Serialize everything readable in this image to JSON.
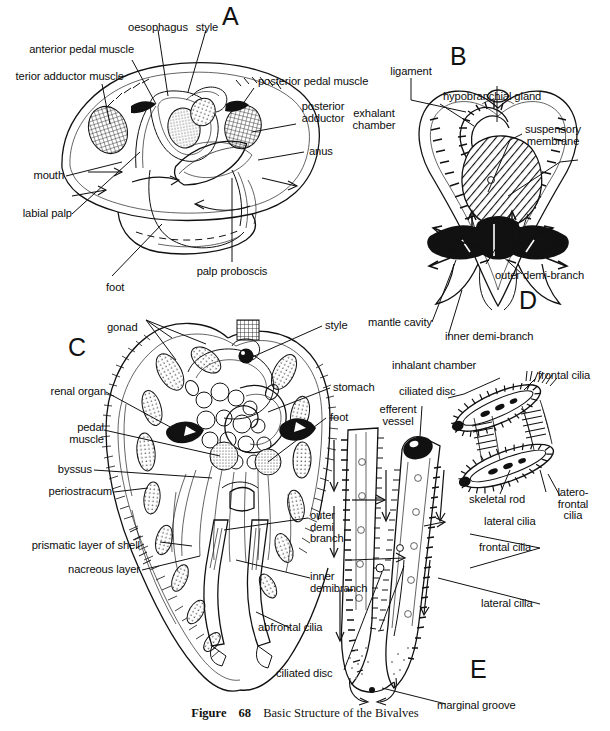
{
  "figure": {
    "caption_label": "Figure",
    "caption_number": "68",
    "caption_title": "Basic Structure of the Bivalves",
    "width": 610,
    "height": 731
  },
  "panels": [
    {
      "id": "A",
      "letter": "A",
      "title": "whole animal, left valve removed"
    },
    {
      "id": "B",
      "letter": "B",
      "title": "transverse section through body"
    },
    {
      "id": "C",
      "letter": "C",
      "title": "transverse section, shell layers"
    },
    {
      "id": "D",
      "letter": "D",
      "title": "gill filaments detail"
    },
    {
      "id": "E",
      "letter": "E",
      "title": "single filament, ciliation"
    }
  ],
  "labels": {
    "panel_a": [
      {
        "name": "oesophagus",
        "text": "oesophagus"
      },
      {
        "name": "style",
        "text": "style"
      },
      {
        "name": "anterior-pedal-muscle",
        "text": "anterior pedal muscle"
      },
      {
        "name": "anterior-adductor-muscle",
        "text": "terior adductor muscle"
      },
      {
        "name": "posterior-pedal-muscle",
        "text": "posterior pedal muscle"
      },
      {
        "name": "posterior-adductor",
        "text": "posterior\nadductor"
      },
      {
        "name": "anus",
        "text": "anus"
      },
      {
        "name": "mouth",
        "text": "mouth"
      },
      {
        "name": "labial-palp",
        "text": "labial palp"
      },
      {
        "name": "foot",
        "text": "foot"
      },
      {
        "name": "palp-proboscis",
        "text": "palp proboscis"
      }
    ],
    "panel_b": [
      {
        "name": "ligament",
        "text": "ligament"
      },
      {
        "name": "hypobranchial-gland",
        "text": "hypobranchial gland"
      },
      {
        "name": "exhalant-chamber",
        "text": "exhalant\nchamber"
      },
      {
        "name": "suspensory-membrane",
        "text": "suspensory\nmembrane"
      },
      {
        "name": "outer-demi-branch",
        "text": "outer demi-branch"
      },
      {
        "name": "inner-demi-branch",
        "text": "inner demi-branch"
      },
      {
        "name": "mantle-cavity",
        "text": "mantle cavity"
      },
      {
        "name": "inhalant-chamber",
        "text": "inhalant chamber"
      }
    ],
    "panel_c": [
      {
        "name": "gonad",
        "text": "gonad"
      },
      {
        "name": "style",
        "text": "style"
      },
      {
        "name": "renal-organ",
        "text": "renal organ"
      },
      {
        "name": "stomach",
        "text": "stomach"
      },
      {
        "name": "pedal-muscle",
        "text": "pedal\nmuscle"
      },
      {
        "name": "foot",
        "text": "foot"
      },
      {
        "name": "byssus",
        "text": "byssus"
      },
      {
        "name": "periostracum",
        "text": "periostracum"
      },
      {
        "name": "prismatic-layer-of-shell",
        "text": "prismatic layer of shell"
      },
      {
        "name": "nacreous-layer",
        "text": "nacreous layer"
      },
      {
        "name": "outer-demi-branch",
        "text": "outer\ndemi\nbranch"
      },
      {
        "name": "inner-demibranch",
        "text": "inner\ndemibranch"
      }
    ],
    "panel_d": [
      {
        "name": "ciliated-disc",
        "text": "ciliated disc"
      },
      {
        "name": "frontal-cilia",
        "text": "frontal cilia"
      },
      {
        "name": "skeletal-rod",
        "text": "skeletal rod"
      },
      {
        "name": "lateral-cilia",
        "text": "lateral cilia"
      },
      {
        "name": "latero-frontal-cilia",
        "text": "latero-\nfrontal\ncilia"
      }
    ],
    "panel_e": [
      {
        "name": "efferent-vessel",
        "text": "efferent\nvessel"
      },
      {
        "name": "frontal-cilia",
        "text": "frontal cilia"
      },
      {
        "name": "lateral-cilia",
        "text": "lateral cilia"
      },
      {
        "name": "abfrontal-cilia",
        "text": "abfrontal cilia"
      },
      {
        "name": "ciliated-disc",
        "text": "ciliated disc"
      },
      {
        "name": "marginal-groove",
        "text": "marginal groove"
      }
    ]
  },
  "colors": {
    "ink": "#111111",
    "paper": "#ffffff",
    "fill_black": "#111111",
    "fill_hatch": "#5a5a5a"
  }
}
